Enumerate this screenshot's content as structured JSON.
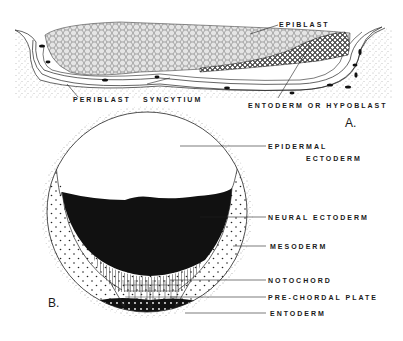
{
  "figure_a": {
    "panel_letter": "A.",
    "labels": {
      "epiblast": "EPIBLAST",
      "periblast": "PERIBLAST",
      "syncytium": "SYNCYTIUM",
      "entoderm_hypoblast": "ENTODERM OR HYPOBLAST"
    }
  },
  "figure_b": {
    "panel_letter": "B.",
    "labels": {
      "epidermal_line1": "EPIDERMAL",
      "epidermal_line2": "ECTODERM",
      "neural_ectoderm": "NEURAL ECTODERM",
      "mesoderm": "MESODERM",
      "notochord": "NOTOCHORD",
      "prechordal_plate": "PRE-CHORDAL PLATE",
      "entoderm": "ENTODERM"
    }
  },
  "colors": {
    "ink": "#1a1a1a",
    "background": "#ffffff",
    "cell_fill": "#d8d8d8"
  }
}
